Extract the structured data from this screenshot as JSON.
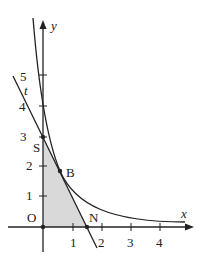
{
  "figure": {
    "type": "coordinate-geometry",
    "axes": {
      "x_label": "x",
      "y_label": "y",
      "x_ticks": [
        "1",
        "2",
        "3",
        "4"
      ],
      "y_ticks": [
        "1",
        "2",
        "3",
        "4",
        "5"
      ],
      "origin_label": "O"
    },
    "points": {
      "S": {
        "label": "S",
        "x": 0,
        "y": 3
      },
      "B": {
        "label": "B",
        "x": 0.6,
        "y": 1.9
      },
      "N": {
        "label": "N",
        "x": 1.5,
        "y": 0
      },
      "O": {
        "label": "O",
        "x": 0,
        "y": 0
      }
    },
    "line_label": "t",
    "colors": {
      "stroke": "#222222",
      "shade": "#d9d9d9"
    }
  }
}
